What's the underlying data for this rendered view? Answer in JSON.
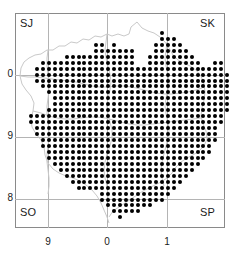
{
  "figure": {
    "type": "distribution-map",
    "dot_color": "#000000",
    "gridline_color": "#b4b4b4",
    "frame_color": "#8a8a8a",
    "coastline_color": "#c8c8c8"
  },
  "grid_squares": {
    "top_left": "SJ",
    "top_right": "SK",
    "bottom_left": "SO",
    "bottom_right": "SP"
  },
  "axes": {
    "x_ticks": [
      {
        "label": "9",
        "px": 48
      },
      {
        "label": "0",
        "px": 107
      },
      {
        "label": "1",
        "px": 167
      }
    ],
    "y_ticks": [
      {
        "label": "0",
        "px": 75
      },
      {
        "label": "9",
        "px": 137
      },
      {
        "label": "8",
        "px": 199
      }
    ],
    "gridlines_v": [
      48,
      107,
      167
    ],
    "gridlines_h": [
      75,
      137,
      199
    ]
  },
  "dot_grid": {
    "origin_x": 19,
    "origin_y": 21,
    "step": 5.95,
    "dot_size": 4,
    "comment": "rows array: each entry is [row_index, [col_index,...]] of filled cells",
    "rows": [
      [
        2,
        [
          24
        ]
      ],
      [
        3,
        [
          24,
          25,
          26
        ]
      ],
      [
        4,
        [
          13,
          14,
          16,
          23,
          24,
          25,
          26,
          27
        ]
      ],
      [
        5,
        [
          13,
          14,
          15,
          16,
          17,
          18,
          19,
          23,
          24,
          25,
          26,
          27,
          28
        ]
      ],
      [
        6,
        [
          8,
          9,
          10,
          11,
          12,
          13,
          14,
          15,
          16,
          17,
          18,
          19,
          22,
          23,
          24,
          25,
          26,
          27,
          28,
          29
        ]
      ],
      [
        7,
        [
          4,
          5,
          6,
          7,
          8,
          9,
          10,
          11,
          12,
          13,
          14,
          15,
          16,
          17,
          18,
          19,
          22,
          23,
          24,
          25,
          26,
          27,
          28,
          29,
          30,
          33,
          34
        ]
      ],
      [
        8,
        [
          3,
          4,
          5,
          6,
          7,
          8,
          9,
          10,
          11,
          12,
          13,
          14,
          15,
          16,
          17,
          18,
          19,
          20,
          21,
          22,
          23,
          24,
          25,
          26,
          27,
          28,
          29,
          30,
          31,
          32,
          33,
          34
        ]
      ],
      [
        9,
        [
          3,
          4,
          5,
          6,
          7,
          8,
          9,
          10,
          11,
          12,
          13,
          14,
          15,
          16,
          17,
          18,
          19,
          20,
          21,
          22,
          23,
          24,
          25,
          26,
          27,
          28,
          29,
          30,
          31,
          32,
          33,
          34,
          35
        ]
      ],
      [
        10,
        [
          3,
          4,
          5,
          6,
          7,
          8,
          9,
          10,
          11,
          12,
          13,
          14,
          15,
          16,
          17,
          18,
          19,
          20,
          21,
          22,
          23,
          24,
          25,
          26,
          27,
          28,
          29,
          30,
          31,
          32,
          33,
          34,
          35
        ]
      ],
      [
        11,
        [
          4,
          5,
          6,
          7,
          8,
          9,
          10,
          11,
          12,
          13,
          14,
          15,
          16,
          17,
          18,
          19,
          20,
          21,
          22,
          23,
          24,
          25,
          26,
          27,
          28,
          29,
          30,
          31,
          32,
          33,
          34,
          35
        ]
      ],
      [
        12,
        [
          5,
          6,
          7,
          8,
          9,
          10,
          11,
          12,
          13,
          14,
          15,
          16,
          17,
          18,
          19,
          20,
          21,
          22,
          23,
          24,
          25,
          26,
          27,
          28,
          29,
          30,
          31,
          32,
          33,
          34,
          35
        ]
      ],
      [
        13,
        [
          6,
          7,
          8,
          9,
          10,
          11,
          12,
          13,
          14,
          15,
          16,
          17,
          18,
          19,
          20,
          21,
          22,
          23,
          24,
          25,
          26,
          27,
          28,
          29,
          30,
          31,
          32,
          33,
          34,
          35
        ]
      ],
      [
        14,
        [
          6,
          7,
          8,
          9,
          10,
          11,
          12,
          13,
          14,
          15,
          16,
          17,
          18,
          19,
          20,
          21,
          22,
          23,
          24,
          25,
          26,
          27,
          28,
          29,
          30,
          31,
          32,
          33,
          34,
          35
        ]
      ],
      [
        15,
        [
          5,
          6,
          7,
          8,
          9,
          10,
          11,
          12,
          13,
          14,
          15,
          16,
          17,
          18,
          19,
          20,
          21,
          22,
          23,
          24,
          25,
          26,
          27,
          28,
          29,
          30,
          31,
          32,
          33,
          34,
          35
        ]
      ],
      [
        16,
        [
          2,
          3,
          4,
          5,
          6,
          7,
          8,
          9,
          10,
          11,
          12,
          13,
          14,
          15,
          16,
          17,
          18,
          19,
          20,
          21,
          22,
          23,
          24,
          25,
          26,
          27,
          28,
          29,
          30,
          31,
          32,
          33,
          34
        ]
      ],
      [
        17,
        [
          2,
          3,
          4,
          5,
          6,
          7,
          8,
          9,
          10,
          11,
          12,
          13,
          14,
          15,
          16,
          17,
          18,
          19,
          20,
          21,
          22,
          23,
          24,
          25,
          26,
          27,
          28,
          29,
          30,
          31,
          32,
          33,
          34
        ]
      ],
      [
        18,
        [
          3,
          4,
          5,
          6,
          7,
          8,
          9,
          10,
          11,
          12,
          13,
          14,
          15,
          16,
          17,
          18,
          19,
          20,
          21,
          22,
          23,
          24,
          25,
          26,
          27,
          28,
          29,
          30,
          31,
          32,
          33
        ]
      ],
      [
        19,
        [
          3,
          4,
          5,
          6,
          7,
          8,
          9,
          10,
          11,
          12,
          13,
          14,
          15,
          16,
          17,
          18,
          19,
          20,
          21,
          22,
          23,
          24,
          25,
          26,
          27,
          28,
          29,
          30,
          31,
          32,
          33
        ]
      ],
      [
        20,
        [
          4,
          5,
          6,
          7,
          8,
          9,
          10,
          11,
          12,
          13,
          14,
          15,
          16,
          17,
          18,
          19,
          20,
          21,
          22,
          23,
          24,
          25,
          26,
          27,
          28,
          29,
          30,
          31,
          32,
          33
        ]
      ],
      [
        21,
        [
          4,
          5,
          6,
          7,
          8,
          9,
          10,
          11,
          12,
          13,
          14,
          15,
          16,
          17,
          18,
          19,
          20,
          21,
          22,
          23,
          24,
          25,
          26,
          27,
          28,
          29,
          30,
          31,
          32
        ]
      ],
      [
        22,
        [
          5,
          6,
          7,
          8,
          9,
          10,
          11,
          12,
          13,
          14,
          15,
          16,
          17,
          18,
          19,
          20,
          21,
          22,
          23,
          24,
          25,
          26,
          27,
          28,
          29,
          30,
          31,
          32
        ]
      ],
      [
        23,
        [
          5,
          6,
          7,
          8,
          9,
          10,
          11,
          12,
          13,
          14,
          15,
          16,
          17,
          18,
          19,
          20,
          21,
          22,
          23,
          24,
          25,
          26,
          27,
          28,
          29,
          30,
          31
        ]
      ],
      [
        24,
        [
          6,
          7,
          8,
          9,
          10,
          11,
          12,
          13,
          14,
          15,
          16,
          17,
          18,
          19,
          20,
          21,
          22,
          23,
          24,
          25,
          26,
          27,
          28,
          29,
          30
        ]
      ],
      [
        25,
        [
          7,
          8,
          9,
          10,
          11,
          12,
          13,
          14,
          15,
          16,
          17,
          18,
          19,
          20,
          21,
          22,
          23,
          24,
          25,
          26,
          27,
          28,
          29
        ]
      ],
      [
        26,
        [
          8,
          9,
          10,
          11,
          12,
          13,
          14,
          15,
          16,
          17,
          18,
          19,
          20,
          21,
          22,
          23,
          24,
          25,
          26,
          27,
          28
        ]
      ],
      [
        27,
        [
          9,
          10,
          11,
          12,
          13,
          14,
          15,
          16,
          17,
          18,
          19,
          20,
          21,
          22,
          23,
          24,
          25,
          26,
          27
        ]
      ],
      [
        28,
        [
          10,
          11,
          12,
          13,
          14,
          15,
          16,
          17,
          18,
          19,
          20,
          21,
          22,
          23,
          24,
          25,
          26
        ]
      ],
      [
        29,
        [
          14,
          15,
          16,
          17,
          18,
          19,
          20,
          21,
          22,
          23,
          24,
          25
        ]
      ],
      [
        30,
        [
          14,
          15,
          16,
          17,
          18,
          19,
          20,
          21,
          22,
          23,
          24
        ]
      ],
      [
        31,
        [
          15,
          16,
          17,
          18,
          19,
          20,
          21,
          22
        ]
      ],
      [
        32,
        [
          16,
          17,
          18,
          19,
          20
        ]
      ],
      [
        33,
        [
          17
        ]
      ]
    ]
  }
}
